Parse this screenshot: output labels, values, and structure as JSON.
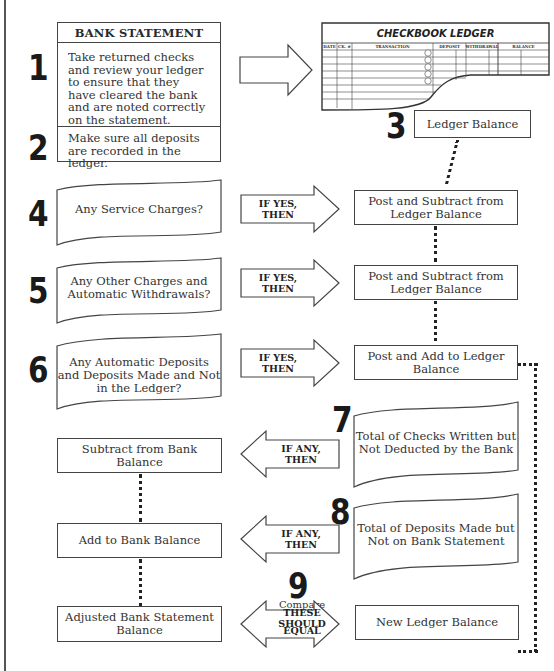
{
  "bank_statement": {
    "title": "BANK STATEMENT",
    "step1": {
      "number": "1",
      "text": "Take returned checks and review your ledger to ensure that they have cleared the bank and are noted correctly on the statement."
    },
    "step2": {
      "number": "2",
      "text": "Make sure all deposits are recorded in the ledger."
    }
  },
  "checkbook_ledger": {
    "title": "CHECKBOOK LEDGER",
    "columns": [
      "DATE",
      "CK. #",
      "TRANSACTION",
      "DEPOSIT",
      "WITHDRAWAL",
      "BALANCE"
    ]
  },
  "step3": {
    "number": "3",
    "label": "Ledger Balance"
  },
  "questions": [
    {
      "number": "4",
      "text": "Any Service Charges?",
      "arrow": "IF YES, THEN",
      "action": "Post and Subtract from Ledger Balance"
    },
    {
      "number": "5",
      "text": "Any Other Charges and Automatic Withdrawals?",
      "arrow": "IF YES, THEN",
      "action": "Post and Subtract from Ledger Balance"
    },
    {
      "number": "6",
      "text": "Any Automatic Deposits and Deposits Made and Not in the Ledger?",
      "arrow": "IF YES, THEN",
      "action": "Post and Add to Ledger Balance"
    }
  ],
  "outstanding": [
    {
      "number": "7",
      "text": "Total of Checks Written but Not Deducted by the Bank",
      "arrow": "IF ANY, THEN",
      "action": "Subtract from Bank Balance"
    },
    {
      "number": "8",
      "text": "Total of Deposits Made but Not on Bank Statement",
      "arrow": "IF ANY, THEN",
      "action": "Add to Bank Balance"
    }
  ],
  "compare": {
    "number": "9",
    "caption": "Compare",
    "arrow_line1": "THESE SHOULD",
    "arrow_line2": "EQUAL",
    "left": "Adjusted Bank Statement Balance",
    "right": "New Ledger Balance"
  }
}
